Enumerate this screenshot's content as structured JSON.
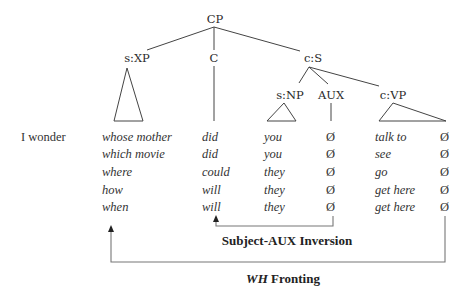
{
  "tree": {
    "root": "CP",
    "nodes": {
      "cp": "CP",
      "s_xp": "s:XP",
      "c": "C",
      "c_s": "c:S",
      "s_np": "s:NP",
      "aux": "AUX",
      "c_vp": "c:VP"
    }
  },
  "matrix_clause": "I wonder",
  "rows": [
    {
      "wh": "whose mother",
      "c": "did",
      "np": "you",
      "aux": "Ø",
      "vp": "talk to",
      "gap": "Ø"
    },
    {
      "wh": "which movie",
      "c": "did",
      "np": "you",
      "aux": "Ø",
      "vp": "see",
      "gap": "Ø"
    },
    {
      "wh": "where",
      "c": "could",
      "np": "they",
      "aux": "Ø",
      "vp": "go",
      "gap": "Ø"
    },
    {
      "wh": "how",
      "c": "will",
      "np": "they",
      "aux": "Ø",
      "vp": "get here",
      "gap": "Ø"
    },
    {
      "wh": "when",
      "c": "will",
      "np": "they",
      "aux": "Ø",
      "vp": "get here",
      "gap": "Ø"
    }
  ],
  "movements": {
    "subject_aux": "Subject-AUX Inversion",
    "wh_fronting_em": "WH",
    "wh_fronting_rest": " Fronting"
  }
}
